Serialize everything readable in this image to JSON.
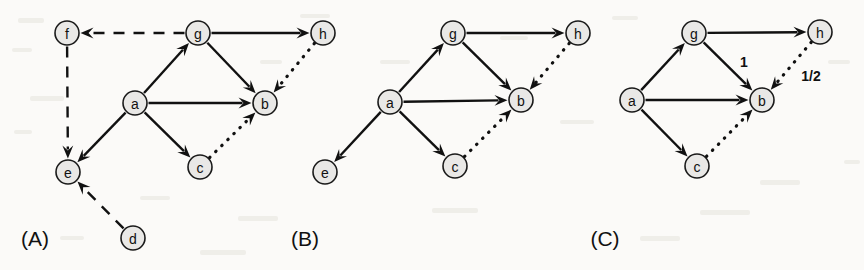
{
  "figure": {
    "background_color": "#fbfaf8",
    "node_fill_color": "#e9e8e6",
    "stroke_color": "#111111",
    "width": 864,
    "height": 270
  },
  "panels": [
    {
      "id": "A",
      "caption": "(A)",
      "caption_pos": {
        "x": 35,
        "y": 238
      },
      "nodes": [
        {
          "id": "f",
          "label": "f",
          "x": 67,
          "y": 33
        },
        {
          "id": "g",
          "label": "g",
          "x": 198,
          "y": 33
        },
        {
          "id": "h",
          "label": "h",
          "x": 323,
          "y": 33
        },
        {
          "id": "a",
          "label": "a",
          "x": 135,
          "y": 103
        },
        {
          "id": "b",
          "label": "b",
          "x": 265,
          "y": 103
        },
        {
          "id": "e",
          "label": "e",
          "x": 68,
          "y": 172
        },
        {
          "id": "c",
          "label": "c",
          "x": 200,
          "y": 167
        },
        {
          "id": "d",
          "label": "d",
          "x": 133,
          "y": 238
        }
      ],
      "edges": [
        {
          "from": "g",
          "to": "f",
          "style": "dashed",
          "label": ""
        },
        {
          "from": "f",
          "to": "e",
          "style": "dashed",
          "label": ""
        },
        {
          "from": "d",
          "to": "e",
          "style": "dashed",
          "label": ""
        },
        {
          "from": "a",
          "to": "g",
          "style": "solid",
          "label": ""
        },
        {
          "from": "a",
          "to": "b",
          "style": "solid",
          "label": ""
        },
        {
          "from": "a",
          "to": "e",
          "style": "solid",
          "label": ""
        },
        {
          "from": "a",
          "to": "c",
          "style": "solid",
          "label": ""
        },
        {
          "from": "g",
          "to": "h",
          "style": "solid",
          "label": ""
        },
        {
          "from": "g",
          "to": "b",
          "style": "solid",
          "label": ""
        },
        {
          "from": "h",
          "to": "b",
          "style": "dotted",
          "label": ""
        },
        {
          "from": "c",
          "to": "b",
          "style": "dotted",
          "label": ""
        }
      ]
    },
    {
      "id": "B",
      "caption": "(B)",
      "caption_pos": {
        "x": 305,
        "y": 238
      },
      "nodes": [
        {
          "id": "g",
          "label": "g",
          "x": 453,
          "y": 33
        },
        {
          "id": "h",
          "label": "h",
          "x": 578,
          "y": 33
        },
        {
          "id": "a",
          "label": "a",
          "x": 390,
          "y": 102
        },
        {
          "id": "b",
          "label": "b",
          "x": 521,
          "y": 100
        },
        {
          "id": "e",
          "label": "e",
          "x": 325,
          "y": 172
        },
        {
          "id": "c",
          "label": "c",
          "x": 455,
          "y": 166
        }
      ],
      "edges": [
        {
          "from": "a",
          "to": "g",
          "style": "solid",
          "label": ""
        },
        {
          "from": "a",
          "to": "b",
          "style": "solid",
          "label": ""
        },
        {
          "from": "a",
          "to": "e",
          "style": "solid",
          "label": ""
        },
        {
          "from": "a",
          "to": "c",
          "style": "solid",
          "label": ""
        },
        {
          "from": "g",
          "to": "h",
          "style": "solid",
          "label": ""
        },
        {
          "from": "g",
          "to": "b",
          "style": "solid",
          "label": ""
        },
        {
          "from": "h",
          "to": "b",
          "style": "dotted",
          "label": ""
        },
        {
          "from": "c",
          "to": "b",
          "style": "dotted",
          "label": ""
        }
      ]
    },
    {
      "id": "C",
      "caption": "(C)",
      "caption_pos": {
        "x": 605,
        "y": 238
      },
      "nodes": [
        {
          "id": "g",
          "label": "g",
          "x": 694,
          "y": 33
        },
        {
          "id": "h",
          "label": "h",
          "x": 820,
          "y": 32
        },
        {
          "id": "a",
          "label": "a",
          "x": 632,
          "y": 100
        },
        {
          "id": "b",
          "label": "b",
          "x": 762,
          "y": 100
        },
        {
          "id": "c",
          "label": "c",
          "x": 697,
          "y": 166
        }
      ],
      "edges": [
        {
          "from": "a",
          "to": "g",
          "style": "solid",
          "label": ""
        },
        {
          "from": "a",
          "to": "b",
          "style": "solid",
          "label": ""
        },
        {
          "from": "a",
          "to": "c",
          "style": "solid",
          "label": ""
        },
        {
          "from": "g",
          "to": "h",
          "style": "solid",
          "label": ""
        },
        {
          "from": "g",
          "to": "b",
          "style": "solid",
          "label": "1",
          "label_pos": {
            "x": 744,
            "y": 62
          }
        },
        {
          "from": "h",
          "to": "b",
          "style": "dotted",
          "label": "1/2",
          "label_pos": {
            "x": 811,
            "y": 76
          }
        },
        {
          "from": "c",
          "to": "b",
          "style": "dotted",
          "label": ""
        }
      ]
    }
  ],
  "node_radius": 12
}
